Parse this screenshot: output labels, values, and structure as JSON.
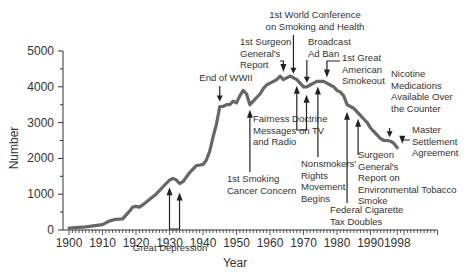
{
  "chart_data": {
    "type": "line",
    "title": "",
    "xlabel": "Year",
    "ylabel": "Number",
    "xlim": [
      1900,
      2010
    ],
    "ylim": [
      0,
      5000
    ],
    "x_ticks": [
      "1900",
      "1910",
      "1920",
      "1930",
      "1940",
      "1950",
      "1960",
      "1970",
      "1980",
      "1990",
      "1998"
    ],
    "y_ticks": [
      "0",
      "1000",
      "2000",
      "3000",
      "4000",
      "5000"
    ],
    "grid": false,
    "legend": null,
    "series": [
      {
        "name": "Number",
        "color": "#666666",
        "x": [
          1900,
          1905,
          1910,
          1912,
          1914,
          1916,
          1918,
          1919,
          1920,
          1921,
          1922,
          1924,
          1926,
          1928,
          1930,
          1931,
          1932,
          1933,
          1934,
          1936,
          1938,
          1940,
          1941,
          1942,
          1943,
          1944,
          1945,
          1946,
          1947,
          1948,
          1949,
          1950,
          1951,
          1952,
          1953,
          1954,
          1955,
          1956,
          1957,
          1958,
          1959,
          1960,
          1961,
          1962,
          1963,
          1964,
          1965,
          1966,
          1967,
          1968,
          1969,
          1970,
          1971,
          1972,
          1973,
          1974,
          1975,
          1976,
          1977,
          1978,
          1979,
          1980,
          1981,
          1982,
          1983,
          1984,
          1985,
          1986,
          1987,
          1988,
          1989,
          1990,
          1991,
          1992,
          1993,
          1994,
          1995,
          1996,
          1997,
          1998
        ],
        "values": [
          54,
          90,
          151,
          250,
          300,
          310,
          520,
          640,
          660,
          640,
          700,
          850,
          1000,
          1200,
          1390,
          1440,
          1400,
          1300,
          1350,
          1600,
          1800,
          1830,
          1950,
          2200,
          2600,
          2950,
          3450,
          3450,
          3500,
          3500,
          3600,
          3550,
          3750,
          3900,
          3800,
          3500,
          3600,
          3700,
          3800,
          3950,
          4050,
          4100,
          4150,
          4200,
          4300,
          4200,
          4250,
          4300,
          4250,
          4200,
          4100,
          4000,
          4000,
          4050,
          4100,
          4150,
          4150,
          4150,
          4100,
          4050,
          4000,
          3900,
          3850,
          3750,
          3500,
          3450,
          3400,
          3300,
          3200,
          3100,
          3000,
          2850,
          2750,
          2650,
          2550,
          2500,
          2500,
          2480,
          2420,
          2300
        ]
      }
    ],
    "annotations": [
      {
        "text": [
          "Great Depression"
        ],
        "years": [
          1930,
          1933
        ]
      },
      {
        "text": [
          "End of WWII"
        ],
        "year": 1945
      },
      {
        "text": [
          "1st Smoking",
          "Cancer Concern"
        ],
        "year": 1953
      },
      {
        "text": [
          "Fairness Doctrine",
          "Messages on TV",
          "and Radio"
        ],
        "year": 1954
      },
      {
        "text": [
          "1st Surgeon",
          "General's",
          "Report"
        ],
        "year": 1964
      },
      {
        "text": [
          "1st World Conference",
          "on Smoking and Health"
        ],
        "year": 1967
      },
      {
        "text": [
          "Broadcast",
          "Ad Ban"
        ],
        "year": 1971
      },
      {
        "text": [
          "1st Great",
          "American",
          "Smokeout"
        ],
        "year": 1977
      },
      {
        "text": [
          "Nonsmokers'",
          "Rights",
          "Movement",
          "Begins"
        ],
        "year": 1974
      },
      {
        "text": [
          "Federal Cigarette",
          "Tax Doubles"
        ],
        "year": 1983
      },
      {
        "text": [
          "Surgeon",
          "General's",
          "Report on",
          "Environmental Tobacco",
          "Smoke"
        ],
        "year": 1986
      },
      {
        "text": [
          "Nicotine",
          "Medications",
          "Available Over",
          "the Counter"
        ],
        "year": 1996
      },
      {
        "text": [
          "Master",
          "Settlement",
          "Agreement"
        ],
        "year": 1998
      }
    ]
  }
}
